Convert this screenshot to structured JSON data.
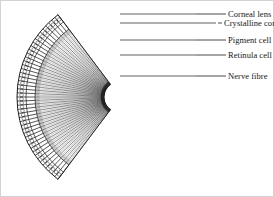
{
  "figure": {
    "ink_color": "#1d1d1d",
    "background_color": "#ffffff",
    "border_color": "#c9c9c9"
  },
  "labels": [
    {
      "id": "corneal-lens",
      "text": "Corneal lens",
      "leader_y": 14,
      "text_x": 228,
      "text_y": 10,
      "leader_x1": 196,
      "leader_x2": 226
    },
    {
      "id": "crystalline-cone",
      "text": "Crystalline cone",
      "leader_y": 23,
      "text_x": 224,
      "text_y": 19,
      "leader_x1": 218,
      "leader_x2": 222
    },
    {
      "id": "pigment-cell",
      "text": "Pigment cell",
      "leader_y": 40,
      "text_x": 228,
      "text_y": 36,
      "leader_x1": 196,
      "leader_x2": 226
    },
    {
      "id": "retinula-cell",
      "text": "Retinula cell",
      "leader_y": 55,
      "text_x": 228,
      "text_y": 51,
      "leader_x1": 196,
      "leader_x2": 226
    },
    {
      "id": "nerve-fibre",
      "text": "Nerve fibre",
      "leader_y": 76,
      "text_x": 228,
      "text_y": 72,
      "leader_x1": 196,
      "leader_x2": 226
    }
  ],
  "geometry": {
    "center_x": 120,
    "center_y": 97,
    "outer_radius": 103,
    "lens_band_inner_radius": 94,
    "cone_band_inner_radius": 85,
    "inner_radius": 16,
    "angle_start_deg": 127,
    "angle_end_deg": 233,
    "ommatidia_count": 46,
    "leader_attach_x": 120
  }
}
